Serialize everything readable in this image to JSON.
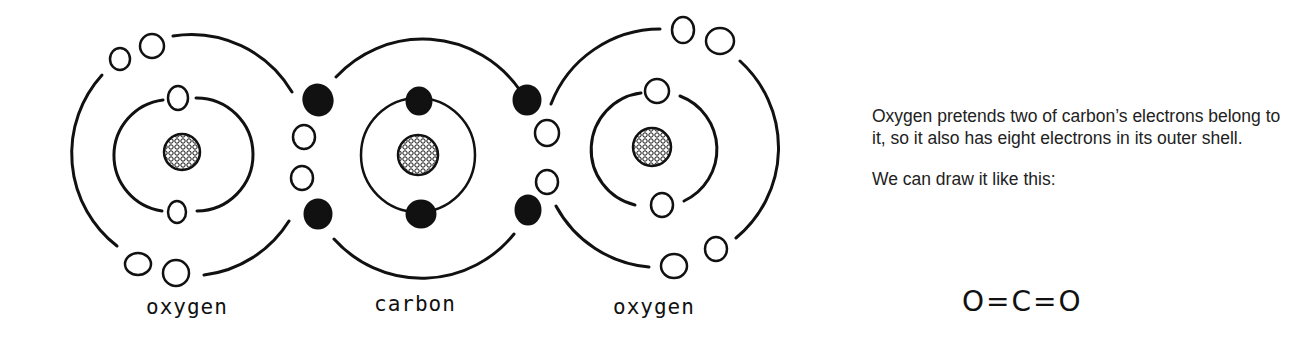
{
  "diagram": {
    "atoms": [
      {
        "name": "oxygen",
        "label": "oxygen",
        "nucleus_center": [
          182,
          152
        ],
        "inner_shell_electrons": 2,
        "outer_shell_electrons": 6,
        "shared_electrons": 4
      },
      {
        "name": "carbon",
        "label": "carbon",
        "nucleus_center": [
          418,
          155
        ],
        "inner_shell_electrons": 2,
        "outer_shell_electrons": 4,
        "electron_style": "filled"
      },
      {
        "name": "oxygen",
        "label": "oxygen",
        "nucleus_center": [
          655,
          148
        ],
        "inner_shell_electrons": 2,
        "outer_shell_electrons": 6,
        "shared_electrons": 4
      }
    ],
    "legend": {
      "open_circle": "oxygen electron",
      "filled_circle": "carbon electron"
    }
  },
  "labels": {
    "left_atom": "oxygen",
    "center_atom": "carbon",
    "right_atom": "oxygen"
  },
  "explanation": {
    "paragraph1": "Oxygen pretends two of carbon’s electrons belong to it, so it also has eight electrons in its outer shell.",
    "paragraph2": "We can draw it like this:",
    "formula": "O=C=O"
  }
}
